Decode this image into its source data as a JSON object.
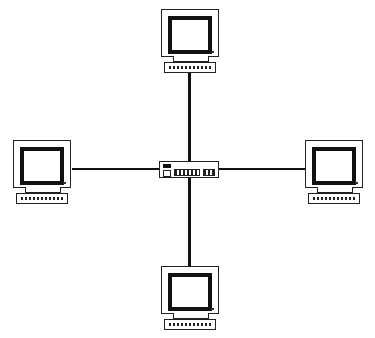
{
  "diagram": {
    "type": "star network topology",
    "center": {
      "kind": "hub",
      "label": ""
    },
    "nodes": [
      {
        "id": "top",
        "kind": "workstation"
      },
      {
        "id": "left",
        "kind": "workstation"
      },
      {
        "id": "right",
        "kind": "workstation"
      },
      {
        "id": "bottom",
        "kind": "workstation"
      }
    ],
    "edges": [
      {
        "from": "hub",
        "to": "top"
      },
      {
        "from": "hub",
        "to": "left"
      },
      {
        "from": "hub",
        "to": "right"
      },
      {
        "from": "hub",
        "to": "bottom"
      }
    ],
    "colors": {
      "line": "#111111",
      "background": "#ffffff"
    }
  }
}
